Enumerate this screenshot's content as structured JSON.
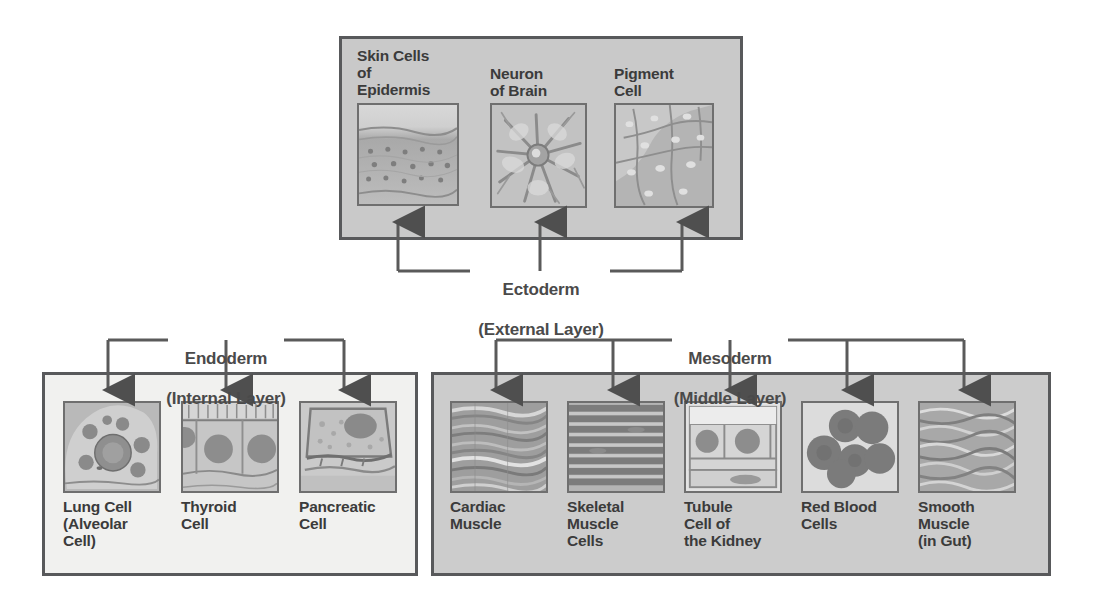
{
  "diagram": {
    "colors": {
      "panel_border": "#58595b",
      "ectoderm_bg": "#c9c9c9",
      "endoderm_bg": "#f1f1ef",
      "mesoderm_bg": "#cccccc",
      "connector": "#5a5a5a",
      "text": "#3b3b3b"
    }
  },
  "ectoderm": {
    "name": "Ectoderm",
    "sublabel": "(External Layer)",
    "label_line1": "Ectoderm",
    "label_line2": "(External Layer)",
    "cells": [
      {
        "id": "skin",
        "label": "Skin Cells\nof\nEpidermis",
        "image": "skin-epidermis-micrograph"
      },
      {
        "id": "neuron",
        "label": "Neuron\nof Brain",
        "image": "neuron-micrograph"
      },
      {
        "id": "pigment",
        "label": "Pigment\nCell",
        "image": "pigment-cell-micrograph"
      }
    ]
  },
  "endoderm": {
    "name": "Endoderm",
    "sublabel": "(Internal Layer)",
    "label_line1": "Endoderm",
    "label_line2": "(Internal Layer)",
    "cells": [
      {
        "id": "lung",
        "label": "Lung Cell\n(Alveolar\nCell)",
        "image": "lung-alveolar-cell-micrograph"
      },
      {
        "id": "thyroid",
        "label": "Thyroid\nCell",
        "image": "thyroid-cell-micrograph"
      },
      {
        "id": "pancreatic",
        "label": "Pancreatic\nCell",
        "image": "pancreatic-cell-micrograph"
      }
    ]
  },
  "mesoderm": {
    "name": "Mesoderm",
    "sublabel": "(Middle Layer)",
    "label_line1": "Mesoderm",
    "label_line2": "(Middle Layer)",
    "cells": [
      {
        "id": "cardiac",
        "label": "Cardiac\nMuscle",
        "image": "cardiac-muscle-micrograph"
      },
      {
        "id": "skeletal",
        "label": "Skeletal\nMuscle\nCells",
        "image": "skeletal-muscle-micrograph"
      },
      {
        "id": "tubule",
        "label": "Tubule\nCell of\nthe Kidney",
        "image": "kidney-tubule-cell-micrograph"
      },
      {
        "id": "rbc",
        "label": "Red Blood\nCells",
        "image": "red-blood-cells-micrograph"
      },
      {
        "id": "smooth",
        "label": "Smooth\nMuscle\n(in Gut)",
        "image": "smooth-muscle-micrograph"
      }
    ]
  }
}
